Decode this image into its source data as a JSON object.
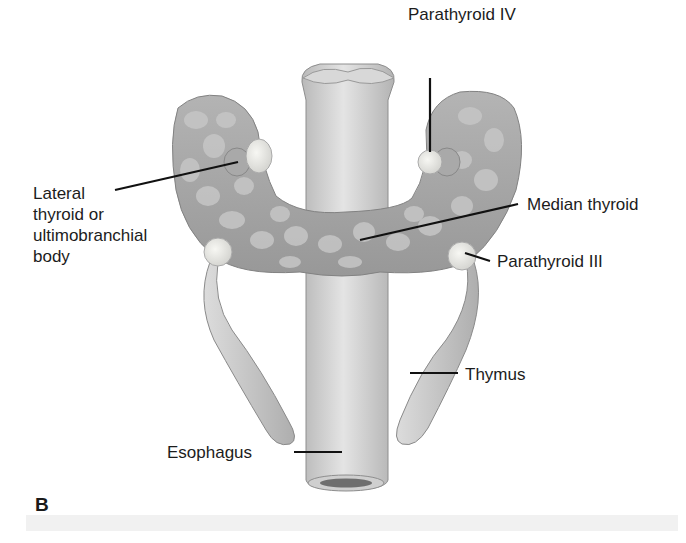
{
  "figure": {
    "panel_label": "B",
    "labels": {
      "parathyroid_iv": "Parathyroid IV",
      "lateral_thyroid": "Lateral\nthyroid or\nultimobranchial\nbody",
      "median_thyroid": "Median thyroid",
      "parathyroid_iii": "Parathyroid III",
      "thymus": "Thymus",
      "esophagus": "Esophagus"
    },
    "colors": {
      "thyroid": "#a7a7a7",
      "thyroid_lobule": "#c4c4c4",
      "parathyroid": "#e6e6e2",
      "esophagus": "#d3d3d3",
      "thymus": "#c9c9c9",
      "leader_line": "#111111"
    }
  }
}
